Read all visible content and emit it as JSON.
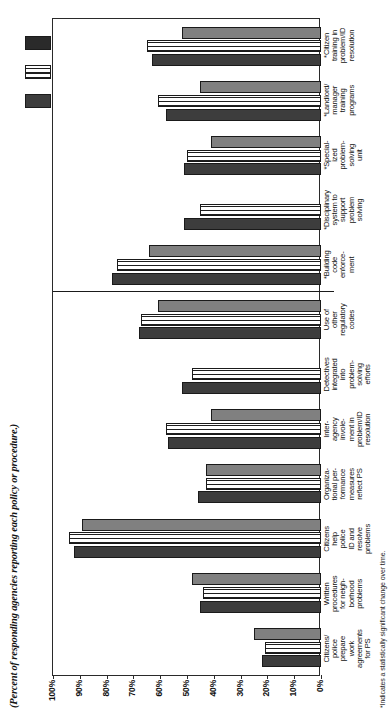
{
  "subtitle": "(Percent of responding agencies reporting each policy or procedure.)",
  "footnote": "*Indicates a statistically significant change over time.",
  "axis": {
    "ticks": [
      "100%",
      "90%",
      "80%",
      "70%",
      "60%",
      "50%",
      "40%",
      "30%",
      "20%",
      "10%",
      "0%"
    ]
  },
  "legend": {
    "items": [
      {
        "label": "",
        "swatch_name": "legend-swatch-series-1",
        "color": "#3d3d3d"
      },
      {
        "label": "",
        "swatch_name": "legend-swatch-series-2",
        "color": "#ffffff"
      },
      {
        "label": "",
        "swatch_name": "legend-swatch-series-3",
        "color": "#2a2a2a"
      }
    ]
  },
  "chart_data": {
    "type": "bar",
    "orientation": "horizontal",
    "title": "",
    "subtitle": "(Percent of responding agencies reporting each policy or procedure.)",
    "xlabel": "",
    "ylabel": "",
    "ylim": [
      0,
      100
    ],
    "yticks": [
      0,
      10,
      20,
      30,
      40,
      50,
      60,
      70,
      80,
      90,
      100
    ],
    "grid": false,
    "legend_position": "top-left",
    "note": "*Indicates a statistically significant change over time.",
    "categories": [
      "Citizens/ police prepare work agreements for PS",
      "Written procedures for neighborhood problems",
      "Citizens help police ID and resolve problems",
      "Organizational performance measures reflect PS",
      "Inter-agency involvement in problem/ID resolution",
      "Detectives integrated into problem-solving efforts",
      "Use of other regulatory codes",
      "*Building code enforcement",
      "*Disciplinary system to support problem solving",
      "*Specialized problem-solving unit",
      "*Landlord/ manager training programs",
      "*Citizen training in problem/ID resolution"
    ],
    "categories_lines": [
      [
        "Citizens/",
        "police",
        "prepare",
        "work",
        "agreements",
        "for PS"
      ],
      [
        "Written",
        "procedures",
        "for neigh-",
        "borhood",
        "problems"
      ],
      [
        "Citizens",
        "help",
        "police",
        "ID and",
        "resolve",
        "problems"
      ],
      [
        "Organiza-",
        "tional per-",
        "formance",
        "measures",
        "reflect PS"
      ],
      [
        "Inter-",
        "agency",
        "invole-",
        "ment in",
        "problem/ID",
        "resolution"
      ],
      [
        "Detectives",
        "integrated",
        "into",
        "problem-",
        "solving",
        "efforts"
      ],
      [
        "Use of",
        "other",
        "regulatory",
        "codes"
      ],
      [
        "*Building",
        "code",
        "enforce-",
        "ment"
      ],
      [
        "*Disciplinary",
        "system to",
        "support",
        "problem",
        "solving"
      ],
      [
        "*Special-",
        "ized",
        "problem-",
        "solving",
        "unit"
      ],
      [
        "*Landlord/",
        "manager",
        "training",
        "programs"
      ],
      [
        "*Citizen",
        "training in",
        "problem/ID",
        "resolution"
      ]
    ],
    "series": [
      {
        "name": "series-1",
        "color": "#3d3d3d",
        "values": [
          22,
          45,
          92,
          46,
          57,
          52,
          68,
          78,
          51,
          51,
          58,
          63
        ]
      },
      {
        "name": "series-2",
        "color": "#ffffff",
        "values": [
          21,
          44,
          94,
          43,
          58,
          48,
          67,
          76,
          45,
          50,
          61,
          65
        ]
      },
      {
        "name": "series-3",
        "color": "#808080",
        "values": [
          25,
          48,
          89,
          43,
          41,
          null,
          61,
          64,
          null,
          41,
          45,
          52
        ]
      }
    ],
    "separator_after_category_index": 6
  }
}
